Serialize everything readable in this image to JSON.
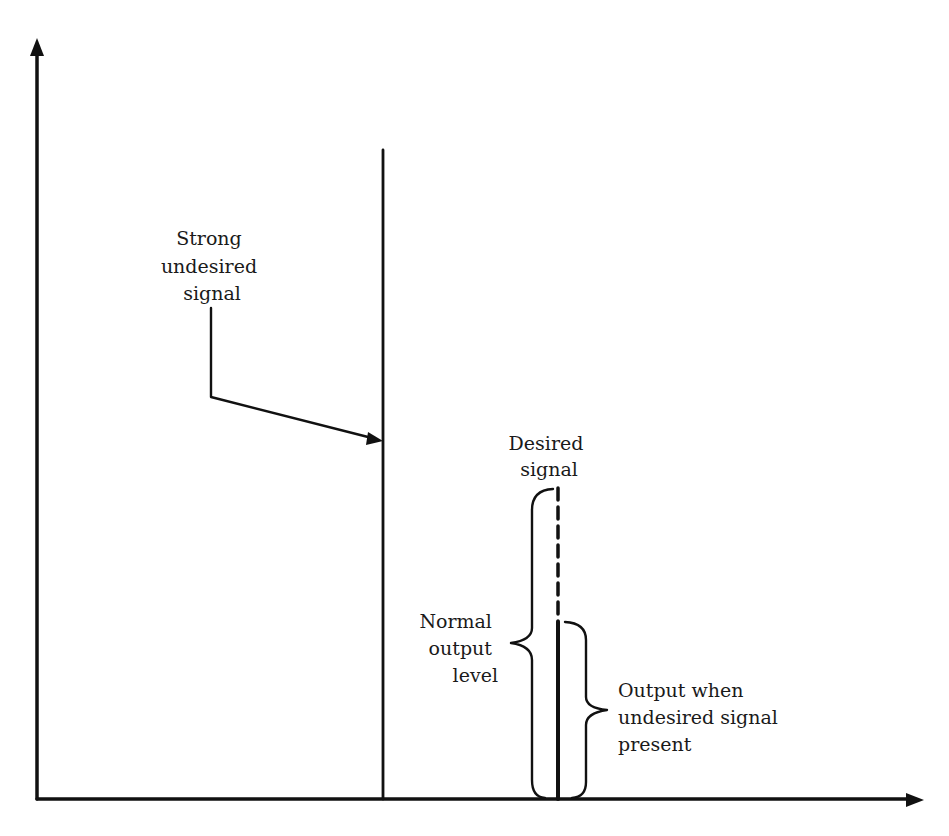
{
  "diagram": {
    "type": "signal-level-diagram",
    "axes": {
      "y_axis": {
        "label": "",
        "arrow": true
      },
      "x_axis": {
        "label": "",
        "arrow": true
      }
    },
    "labels": {
      "strong_signal": [
        "Strong",
        "undesired",
        "signal"
      ],
      "desired_signal": [
        "Desired",
        "signal"
      ],
      "normal_output": [
        "Normal",
        "output",
        "level"
      ],
      "reduced_output": [
        "Output when",
        "undesired signal",
        "present"
      ]
    },
    "signals": [
      {
        "name": "Strong undesired signal",
        "relative_level": 0.85,
        "style": "solid"
      },
      {
        "name": "Desired signal (normal)",
        "relative_level": 0.41,
        "style": "dashed"
      },
      {
        "name": "Desired signal (with interference)",
        "relative_level": 0.23,
        "style": "solid"
      }
    ],
    "colors": {
      "ink": "#111111",
      "background": "#ffffff"
    }
  }
}
